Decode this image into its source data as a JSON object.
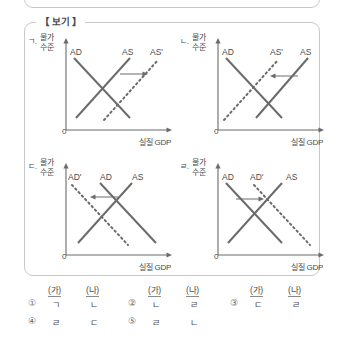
{
  "box": {
    "label": "【 보기 】"
  },
  "axis": {
    "y_label_line1": "물가",
    "y_label_line2": "수준",
    "x_label": "실질 GDP",
    "origin": "0"
  },
  "graphs": [
    {
      "tag": "ㄱ.",
      "curves": [
        {
          "name": "AD",
          "style": "solid",
          "slope": "down"
        },
        {
          "name": "AS",
          "style": "solid",
          "slope": "up"
        },
        {
          "name": "AS'",
          "style": "dotted",
          "slope": "up"
        }
      ],
      "shift": "right",
      "shifted_curve": "AS"
    },
    {
      "tag": "ㄴ.",
      "curves": [
        {
          "name": "AD",
          "style": "solid",
          "slope": "down"
        },
        {
          "name": "AS'",
          "style": "dotted",
          "slope": "up"
        },
        {
          "name": "AS",
          "style": "solid",
          "slope": "up"
        }
      ],
      "shift": "left",
      "shifted_curve": "AS"
    },
    {
      "tag": "ㄷ.",
      "curves": [
        {
          "name": "AD'",
          "style": "dotted",
          "slope": "down"
        },
        {
          "name": "AD",
          "style": "solid",
          "slope": "down"
        },
        {
          "name": "AS",
          "style": "solid",
          "slope": "up"
        }
      ],
      "shift": "left",
      "shifted_curve": "AD"
    },
    {
      "tag": "ㄹ.",
      "curves": [
        {
          "name": "AD",
          "style": "solid",
          "slope": "down"
        },
        {
          "name": "AD'",
          "style": "dotted",
          "slope": "down"
        },
        {
          "name": "AS",
          "style": "solid",
          "slope": "up"
        }
      ],
      "shift": "right",
      "shifted_curve": "AD"
    }
  ],
  "choices": {
    "header_ga": "(가)",
    "header_na": "(나)",
    "items": [
      {
        "num": "①",
        "ga": "ㄱ",
        "na": "ㄴ"
      },
      {
        "num": "②",
        "ga": "ㄴ",
        "na": "ㄹ"
      },
      {
        "num": "③",
        "ga": "ㄷ",
        "na": "ㄹ"
      },
      {
        "num": "④",
        "ga": "ㄹ",
        "na": "ㄷ"
      },
      {
        "num": "⑤",
        "ga": "ㄹ",
        "na": "ㄴ"
      }
    ]
  },
  "colors": {
    "line": "#6b6b6b",
    "border": "#c9c9c9",
    "text": "#4a4a4a"
  }
}
